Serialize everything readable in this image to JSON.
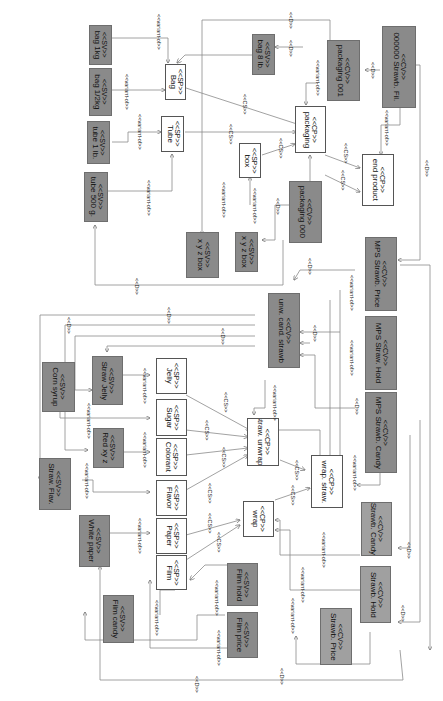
{
  "diagram": {
    "stereotypes": {
      "sv": "<<SV>>",
      "sp": "<<SP>>",
      "cp": "<<CP>>",
      "cv": "<<CV>>",
      "cs": "<<CS>>",
      "d": "<<D>>",
      "variant_of": "<<variant-of>>"
    },
    "nodes": [
      {
        "id": "bag1kg",
        "type": "sv",
        "stereo": "<<SV>>",
        "name": "bag 1kg"
      },
      {
        "id": "bag12kg",
        "type": "sv",
        "stereo": "<<SV>>",
        "name": "bag 1/2kg"
      },
      {
        "id": "tube1lb",
        "type": "sv",
        "stereo": "<<SV>>",
        "name": "tube 1 lb."
      },
      {
        "id": "tube500g",
        "type": "sv",
        "stereo": "<<SV>>",
        "name": "tube 500 g."
      },
      {
        "id": "bag",
        "type": "sp",
        "stereo": "<<SP>>",
        "name": "Bag"
      },
      {
        "id": "tube",
        "type": "sp",
        "stereo": "<<SP>>",
        "name": "Tube"
      },
      {
        "id": "bag8lb",
        "type": "sv",
        "stereo": "<<SV>>",
        "name": "bag 8 lb."
      },
      {
        "id": "packaging001",
        "type": "cv",
        "stereo": "<<CV>>",
        "name": "packaging 001"
      },
      {
        "id": "strawbfil",
        "type": "cv",
        "stereo": "<<CV>>",
        "name": "000000 Strawb. Fil."
      },
      {
        "id": "packaging",
        "type": "cp",
        "stereo": "<<CP>>",
        "name": "packaging"
      },
      {
        "id": "box",
        "type": "sp",
        "stereo": "<<SP>>",
        "name": "box"
      },
      {
        "id": "endproduct",
        "type": "cp",
        "stereo": "<<CP>>",
        "name": "end product"
      },
      {
        "id": "xyzbox",
        "type": "sv",
        "stereo": "<<SV>>",
        "name": "x y z box"
      },
      {
        "id": "xyzbox2",
        "type": "sv",
        "stereo": "<<SV>>",
        "name": "x y z box"
      },
      {
        "id": "packaging000",
        "type": "cv",
        "stereo": "<<CV>>",
        "name": "packaging 000"
      },
      {
        "id": "mpsprice",
        "type": "cv",
        "stereo": "<<CV>>",
        "name": "MPS Strawb. Price"
      },
      {
        "id": "unwcandstraw",
        "type": "cv",
        "stereo": "<<CV>>",
        "name": "unw. cand. strawb"
      },
      {
        "id": "mpshold",
        "type": "cv",
        "stereo": "<<CV>>",
        "name": "MPS Straw. Hold"
      },
      {
        "id": "mpscandy",
        "type": "cv",
        "stereo": "<<CV>>",
        "name": "MPS Strawb. Candy"
      },
      {
        "id": "cornsyrup",
        "type": "sv",
        "stereo": "<<SV>>",
        "name": "Corn syrup"
      },
      {
        "id": "strawjelly",
        "type": "sv",
        "stereo": "<<SV>>",
        "name": "Straw Jelly"
      },
      {
        "id": "jelly",
        "type": "sp",
        "stereo": "<<SP>>",
        "name": "Jelly"
      },
      {
        "id": "sugar",
        "type": "sp",
        "stereo": "<<SP>>",
        "name": "Sugar"
      },
      {
        "id": "redxyz",
        "type": "sv",
        "stereo": "<<SV>>",
        "name": "Red xy z"
      },
      {
        "id": "colorant",
        "type": "sp",
        "stereo": "<<SP>>",
        "name": "Colorant"
      },
      {
        "id": "strawunwrap",
        "type": "cp",
        "stereo": "<<CP>>",
        "name": "straw. unwrap."
      },
      {
        "id": "strawflav",
        "type": "sv",
        "stereo": "<<SV>>",
        "name": "Straw. Flav."
      },
      {
        "id": "flavor",
        "type": "sp",
        "stereo": "<<SP>>",
        "name": "Flavor"
      },
      {
        "id": "wrapstraw",
        "type": "cp",
        "stereo": "<<CP>>",
        "name": "wrap. straw."
      },
      {
        "id": "whitepaper",
        "type": "sv",
        "stereo": "<<SV>>",
        "name": "White paper"
      },
      {
        "id": "paper",
        "type": "sp",
        "stereo": "<<SP>>",
        "name": "Paper"
      },
      {
        "id": "wrap",
        "type": "cp",
        "stereo": "<<CP>>",
        "name": "wrap"
      },
      {
        "id": "strawbcandy",
        "type": "cv",
        "stereo": "<<CV>>",
        "name": "Strawb. Candy"
      },
      {
        "id": "film",
        "type": "sp",
        "stereo": "<<SP>>",
        "name": "Film"
      },
      {
        "id": "filmhold",
        "type": "sv",
        "stereo": "<<SV>>",
        "name": "Film hold"
      },
      {
        "id": "filmcandy",
        "type": "sv",
        "stereo": "<<SV>>",
        "name": "Film candy"
      },
      {
        "id": "filmprice",
        "type": "sv",
        "stereo": "<<SV>>",
        "name": "Film price"
      },
      {
        "id": "strawbhold",
        "type": "cv",
        "stereo": "<<CV>>",
        "name": "Strawb. Hold"
      },
      {
        "id": "strawbprice",
        "type": "cv",
        "stereo": "<<CV>>",
        "name": "Strawb. Price"
      }
    ],
    "edge_labels": {
      "variant_of": "<<variant-of>>",
      "cs": "<<CS>>",
      "d": "<<D>>"
    }
  }
}
